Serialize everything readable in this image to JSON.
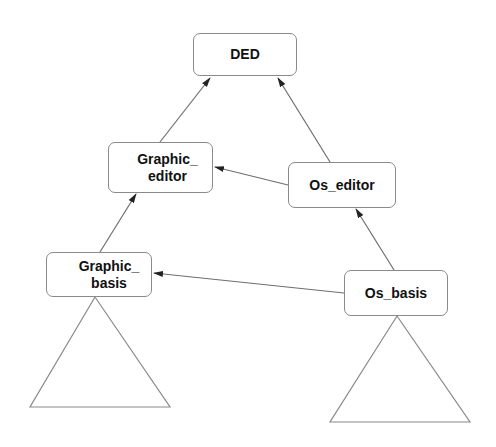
{
  "diagram": {
    "type": "class hierarchy / dependency diagram",
    "nodes": {
      "ded": {
        "label": "DED"
      },
      "graphic_editor": {
        "label": "Graphic_\neditor"
      },
      "os_editor": {
        "label": "Os_editor"
      },
      "graphic_basis": {
        "label": "Graphic_\nbasis"
      },
      "os_basis": {
        "label": "Os_basis"
      }
    },
    "edges": [
      {
        "from": "Graphic_editor",
        "to": "DED"
      },
      {
        "from": "Os_editor",
        "to": "DED"
      },
      {
        "from": "Os_editor",
        "to": "Graphic_editor"
      },
      {
        "from": "Os_basis",
        "to": "Os_editor"
      },
      {
        "from": "Graphic_basis",
        "to": "Graphic_editor"
      },
      {
        "from": "Os_basis",
        "to": "Graphic_basis"
      }
    ],
    "subtrees": [
      "below Graphic_basis",
      "below Os_basis"
    ],
    "colors": {
      "stroke": "#6e6e6e",
      "box_border": "#8a8a8a",
      "text": "#111111",
      "background": "#ffffff"
    }
  }
}
